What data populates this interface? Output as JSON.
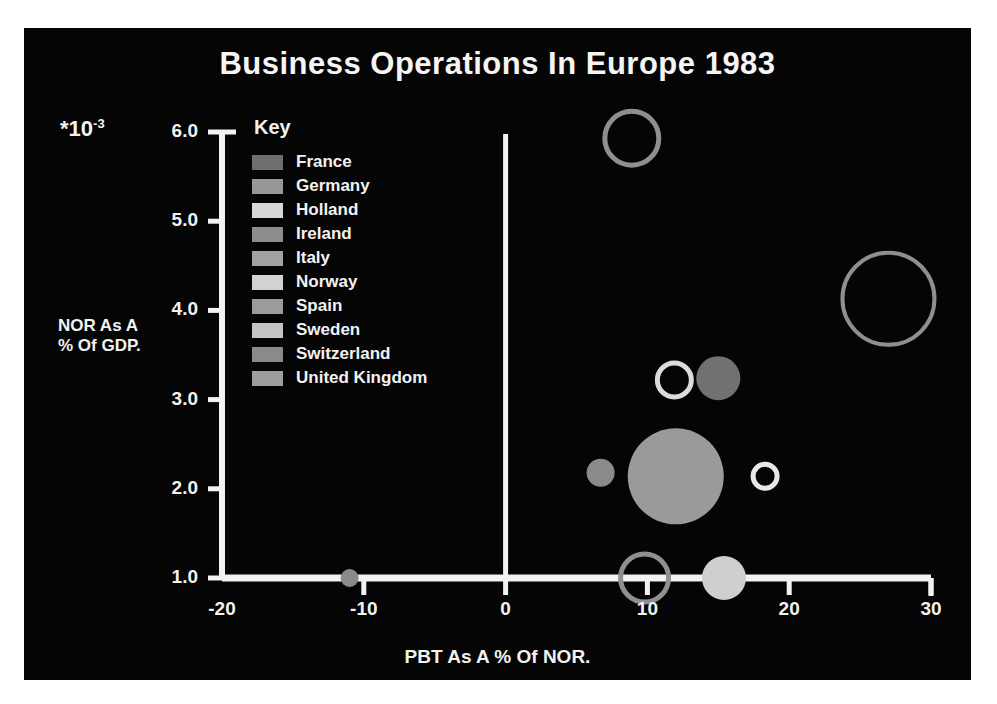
{
  "chart_data": {
    "type": "scatter",
    "title": "Business Operations In Europe 1983",
    "xlabel": "PBT As A % Of NOR.",
    "ylabel": "NOR As A\n% Of GDP.",
    "y_multiplier": "*10",
    "y_exponent": "-3",
    "xlim": [
      -20,
      30
    ],
    "ylim": [
      1.0,
      6.0
    ],
    "xticks": [
      "-20",
      "-10",
      "0",
      "10",
      "20",
      "30"
    ],
    "xtick_values": [
      -20,
      -10,
      0,
      10,
      20,
      30
    ],
    "yticks": [
      "1.0",
      "2.0",
      "3.0",
      "4.0",
      "5.0",
      "6.0"
    ],
    "ytick_values": [
      1.0,
      2.0,
      3.0,
      4.0,
      5.0,
      6.0
    ],
    "grid": false,
    "legend_position": "inside-upper-left",
    "legend_title": "Key",
    "bubble_note": "Bubble area encodes a third variable; open circles are unfilled outlines.",
    "points": [
      {
        "label": "Norway",
        "x": 8.9,
        "y": 5.93,
        "r_px": 27,
        "fill": "none",
        "stroke": "#8f8f8f"
      },
      {
        "label": "Switzerland",
        "x": 27.0,
        "y": 4.13,
        "r_px": 46,
        "fill": "none",
        "stroke": "#8f8f8f"
      },
      {
        "label": "Ireland",
        "x": 11.9,
        "y": 3.22,
        "r_px": 17,
        "fill": "none",
        "stroke": "#dcdcdc"
      },
      {
        "label": "France",
        "x": 15.0,
        "y": 3.24,
        "r_px": 22,
        "fill": "#717171",
        "stroke": "none"
      },
      {
        "label": "Sweden",
        "x": 6.7,
        "y": 2.18,
        "r_px": 14,
        "fill": "#8a8a8a",
        "stroke": "none"
      },
      {
        "label": "Germany",
        "x": 12.0,
        "y": 2.14,
        "r_px": 48,
        "fill": "#9a9a9a",
        "stroke": "none"
      },
      {
        "label": "Spain",
        "x": 18.3,
        "y": 2.14,
        "r_px": 12,
        "fill": "none",
        "stroke": "#e8e8e8"
      },
      {
        "label": "Italy",
        "x": 9.8,
        "y": 1.0,
        "r_px": 24,
        "fill": "none",
        "stroke": "#8f8f8f"
      },
      {
        "label": "Holland",
        "x": 15.4,
        "y": 1.0,
        "r_px": 22,
        "fill": "#cfcfcf",
        "stroke": "none"
      },
      {
        "label": "United Kingdom",
        "x": -11.0,
        "y": 1.0,
        "r_px": 9,
        "fill": "#8a8a8a",
        "stroke": "none"
      }
    ],
    "legend": [
      {
        "label": "France",
        "color": "#6e6e6e"
      },
      {
        "label": "Germany",
        "color": "#979797"
      },
      {
        "label": "Holland",
        "color": "#d7d7d7"
      },
      {
        "label": "Ireland",
        "color": "#8d8d8d"
      },
      {
        "label": "Italy",
        "color": "#a2a2a2"
      },
      {
        "label": "Norway",
        "color": "#d2d2d2"
      },
      {
        "label": "Spain",
        "color": "#9b9b9b"
      },
      {
        "label": "Sweden",
        "color": "#c4c4c4"
      },
      {
        "label": "Switzerland",
        "color": "#8a8a8a"
      },
      {
        "label": "United Kingdom",
        "color": "#9e9e9e"
      }
    ],
    "colors": {
      "background": "#050505",
      "foreground": "#f2f2f2",
      "page": "#ffffff"
    }
  }
}
